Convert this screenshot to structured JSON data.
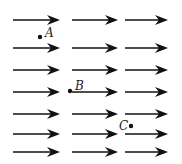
{
  "diagram": {
    "color": "#111111",
    "columns": [
      {
        "x1": 13,
        "x2": 60
      },
      {
        "x1": 72,
        "x2": 118
      },
      {
        "x1": 125,
        "x2": 168
      }
    ],
    "rows_y": [
      20,
      48,
      70,
      92,
      114,
      134,
      152
    ],
    "points": [
      {
        "label": "A",
        "x": 40,
        "y": 37,
        "label_x": 45,
        "label_y": 27
      },
      {
        "label": "B",
        "x": 70,
        "y": 91,
        "label_x": 75,
        "label_y": 80
      },
      {
        "label": "C",
        "x": 131,
        "y": 126,
        "label_x": 119,
        "label_y": 120
      }
    ]
  }
}
